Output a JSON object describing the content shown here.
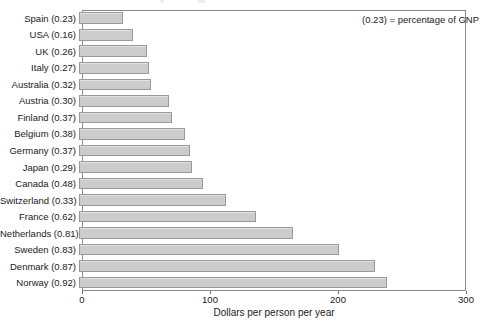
{
  "chart_data": {
    "type": "bar",
    "orientation": "horizontal",
    "title": "",
    "xlabel": "Dollars per person per year",
    "ylabel": "",
    "xlim": [
      0,
      300
    ],
    "xticks": [
      0,
      100,
      200,
      300
    ],
    "xtick_labels": [
      "0",
      "100",
      "200",
      "300"
    ],
    "grid": false,
    "legend_position": "top-right",
    "annotation": "(0.23) = percentage of GNP",
    "bar_color": "#cccccc",
    "bar_edge_color": "#999999",
    "categories": [
      "Spain (0.23)",
      "USA (0.16)",
      "UK (0.26)",
      "Italy (0.27)",
      "Australia (0.32)",
      "Austria (0.30)",
      "Finland (0.37)",
      "Belgium (0.38)",
      "Germany (0.37)",
      "Japan (0.29)",
      "Canada (0.48)",
      "Switzerland (0.33)",
      "France (0.62)",
      "Netherlands (0.81)",
      "Sweden (0.83)",
      "Denmark (0.87)",
      "Norway (0.92)"
    ],
    "values": [
      34,
      42,
      53,
      55,
      56,
      70,
      73,
      83,
      87,
      88,
      97,
      115,
      138,
      167,
      203,
      231,
      241
    ],
    "countries": [
      "Spain",
      "USA",
      "UK",
      "Italy",
      "Australia",
      "Austria",
      "Finland",
      "Belgium",
      "Germany",
      "Japan",
      "Canada",
      "Switzerland",
      "France",
      "Netherlands",
      "Sweden",
      "Denmark",
      "Norway"
    ],
    "gnp_percentages": [
      0.23,
      0.16,
      0.26,
      0.27,
      0.32,
      0.3,
      0.37,
      0.38,
      0.37,
      0.29,
      0.48,
      0.33,
      0.62,
      0.81,
      0.83,
      0.87,
      0.92
    ]
  }
}
